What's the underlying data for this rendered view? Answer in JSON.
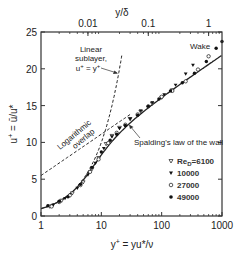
{
  "chart_data": {
    "type": "scatter",
    "title": "",
    "xlabel": "y+ = yu*/ν",
    "ylabel": "u+ = ū/u*",
    "top_xlabel": "y/δ",
    "xscale": "log",
    "xlim": [
      1,
      1000
    ],
    "ylim": [
      0,
      25
    ],
    "x_ticks": [
      1,
      10,
      100,
      1000
    ],
    "x_tick_labels": [
      "1",
      "10",
      "100",
      "1000"
    ],
    "y_ticks": [
      0,
      5,
      10,
      15,
      20,
      25
    ],
    "y_tick_labels": [
      "0",
      "5",
      "10",
      "15",
      "20",
      "25"
    ],
    "top_x_ticks": [
      0.01,
      0.1,
      1
    ],
    "top_x_tick_labels": [
      "0.01",
      "0.1",
      "1"
    ],
    "delta_plus": 600,
    "grid": false,
    "legend_position": "lower right (inside)",
    "legend_title": "Re_D",
    "curves": [
      {
        "name": "Linear sublayer, u+ = y+",
        "style": "dashed",
        "formula": "u+ = y+"
      },
      {
        "name": "Logarithmic overlap",
        "style": "dashed",
        "formula": "u+ = (1/0.41) ln(y+) + 5.5"
      },
      {
        "name": "Spalding's law of the wall",
        "style": "solid",
        "formula": "y+ = u+ + e^(-kB)[e^(k u+) - 1 - k u+ - (k u+)^2/2 - (k u+)^3/6], k=0.41, B=5.0"
      }
    ],
    "series": [
      {
        "name": "Re_D=6100",
        "marker": "open-triangle-down",
        "x": [
          1.4,
          2.2,
          3.3,
          5.0,
          7.0,
          9.0,
          12,
          15,
          20,
          30,
          45,
          70,
          100,
          150
        ],
        "y": [
          1.3,
          2.1,
          3.1,
          4.6,
          6.4,
          7.9,
          9.8,
          10.9,
          12.0,
          13.2,
          14.2,
          15.3,
          16.1,
          17.1
        ]
      },
      {
        "name": "10000",
        "marker": "filled-triangle-down",
        "x": [
          1.6,
          2.5,
          4.0,
          6.0,
          8.0,
          11,
          15,
          20,
          30,
          45,
          70,
          110,
          170,
          250,
          330
        ],
        "y": [
          1.5,
          2.4,
          3.8,
          5.6,
          7.2,
          9.2,
          10.8,
          11.9,
          13.2,
          14.3,
          15.4,
          16.5,
          17.8,
          19.3,
          20.5
        ]
      },
      {
        "name": "27000",
        "marker": "open-circle",
        "x": [
          1.5,
          2.0,
          3.0,
          4.5,
          6.5,
          9.0,
          13,
          18,
          25,
          40,
          60,
          100,
          150,
          250,
          400,
          600
        ],
        "y": [
          1.3,
          1.9,
          2.8,
          4.2,
          6.0,
          7.7,
          9.9,
          11.3,
          12.4,
          13.8,
          14.9,
          16.2,
          17.0,
          18.3,
          19.9,
          21.7
        ]
      },
      {
        "name": "49000",
        "marker": "filled-circle",
        "x": [
          1.3,
          2.0,
          2.8,
          4.5,
          7.0,
          10,
          14,
          18,
          25,
          40,
          60,
          90,
          140,
          220,
          350,
          550,
          800,
          1000
        ],
        "y": [
          1.4,
          2.0,
          2.6,
          4.3,
          6.6,
          8.7,
          10.3,
          11.1,
          12.3,
          13.7,
          14.9,
          15.9,
          17.0,
          18.1,
          19.4,
          21.0,
          22.8,
          23.7
        ]
      }
    ]
  },
  "annotations": {
    "linear_l1": "Linear",
    "linear_l2": "sublayer,",
    "linear_l3": "u+ = y+",
    "log_l1": "Logarithmic",
    "log_l2": "overlap",
    "spalding": "Spalding's law of the wall",
    "wake": "Wake"
  },
  "legend": {
    "items": [
      {
        "label": "Re",
        "sub": "D",
        "suffix": "=6100",
        "marker": "open-triangle-down"
      },
      {
        "label": "10000",
        "marker": "filled-triangle-down"
      },
      {
        "label": "27000",
        "marker": "open-circle"
      },
      {
        "label": "49000",
        "marker": "filled-circle"
      }
    ]
  },
  "colors": {
    "axis": "#333333",
    "data": "#111111",
    "curve": "#222222"
  }
}
